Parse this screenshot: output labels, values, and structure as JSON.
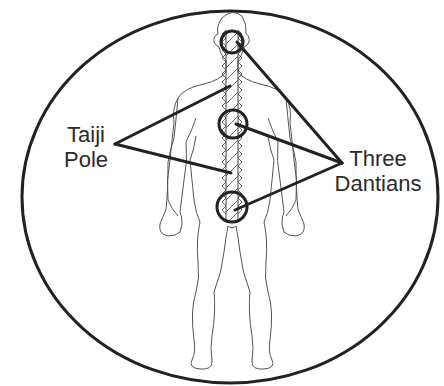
{
  "diagram": {
    "title": "",
    "colors": {
      "background": "#ffffff",
      "ink": "#222222",
      "body_outline": "#555555",
      "text": "#2a2a2a"
    },
    "frame": {
      "shape": "ellipse",
      "cx": 230,
      "cy": 197,
      "rx": 208,
      "ry": 186
    },
    "labels": {
      "taiji_pole": {
        "line1": "Taiji",
        "line2": "Pole"
      },
      "three_dantians": {
        "line1": "Three",
        "line2": "Dantians"
      }
    },
    "dantians": [
      {
        "name": "upper-dantian",
        "cx": 232,
        "cy": 42,
        "r": 11
      },
      {
        "name": "middle-dantian",
        "cx": 233,
        "cy": 124,
        "r": 14
      },
      {
        "name": "lower-dantian",
        "cx": 232,
        "cy": 207,
        "r": 15
      }
    ],
    "pointers": {
      "taiji_pole_apex": [
        115,
        144
      ],
      "taiji_pole_targets": [
        [
          230,
          86
        ],
        [
          231,
          173
        ]
      ],
      "dantian_apex": [
        342,
        163
      ],
      "dantian_targets": [
        [
          237,
          42
        ],
        [
          236,
          124
        ],
        [
          235,
          210
        ]
      ]
    }
  }
}
